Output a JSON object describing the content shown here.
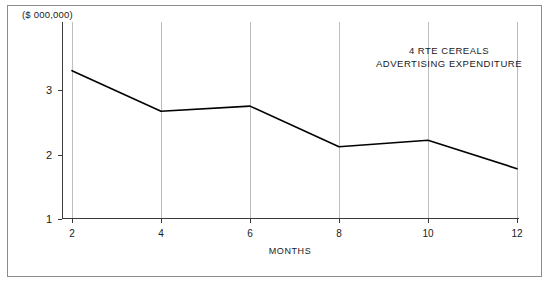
{
  "figure": {
    "y_unit_caption": "($ 000,000)",
    "annotation_line1": "4 RTE CEREALS",
    "annotation_line2": "ADVERTISING EXPENDITURE",
    "x_axis_title": "MONTHS",
    "line_color": "#000000",
    "grid_color": "#bdbdbd",
    "axis_color": "#3a3a3a",
    "frame_color": "#8c8c8c",
    "background": "#ffffff"
  },
  "chart_data": {
    "type": "line",
    "title": "4 RTE CEREALS ADVERTISING EXPENDITURE",
    "xlabel": "MONTHS",
    "ylabel": "($ 000,000)",
    "x": [
      2,
      4,
      6,
      8,
      10,
      12
    ],
    "values": [
      3.3,
      2.67,
      2.75,
      2.12,
      2.22,
      1.78
    ],
    "series": [
      {
        "name": "4 RTE Cereals Advertising Expenditure",
        "values": [
          3.3,
          2.67,
          2.75,
          2.12,
          2.22,
          1.78
        ]
      }
    ],
    "xlim": [
      1,
      13
    ],
    "ylim": [
      1,
      3.6
    ],
    "xticks": [
      2,
      4,
      6,
      8,
      10,
      12
    ],
    "xtick_labels": [
      "2",
      "4",
      "6",
      "8",
      "10",
      "12"
    ],
    "yticks": [
      1,
      2,
      3
    ],
    "ytick_labels": [
      "1",
      "2",
      "3"
    ],
    "grid": "vertical-only",
    "legend": "none"
  }
}
